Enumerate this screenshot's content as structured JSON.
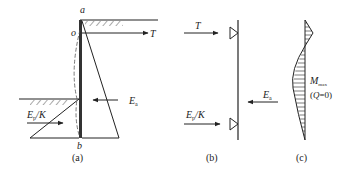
{
  "figure": {
    "panels": [
      {
        "id": "a",
        "caption": "(a)",
        "labels": {
          "top": "a",
          "anchor_point": "o",
          "bottom": "b",
          "tie_force": "T",
          "active_force_main": "E",
          "active_force_sub": "a",
          "passive_force_main": "E",
          "passive_force_sub": "p",
          "passive_force_tail": "/K"
        }
      },
      {
        "id": "b",
        "caption": "(b)",
        "labels": {
          "tie_force": "T",
          "active_force_main": "E",
          "active_force_sub": "a",
          "passive_force_main": "E",
          "passive_force_sub": "p",
          "passive_force_tail": "/K"
        }
      },
      {
        "id": "c",
        "caption": "(c)",
        "labels": {
          "moment_main": "M",
          "moment_sub": "max",
          "condition_open": "(",
          "condition_var": "Q",
          "condition_rest": "=0)"
        }
      }
    ],
    "line_color": "#222222"
  }
}
